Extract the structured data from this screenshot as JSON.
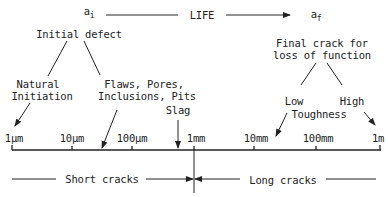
{
  "top": {
    "a_initial": {
      "base": "a",
      "sub": "i"
    },
    "life_label": "LIFE",
    "a_final": {
      "base": "a",
      "sub": "f"
    }
  },
  "initial_defect": {
    "title": "Initial defect",
    "branches": [
      {
        "lines": [
          "Natural",
          "Initiation"
        ]
      },
      {
        "lines": [
          "Flaws, Pores,",
          "Inclusions, Pits"
        ]
      }
    ],
    "slag": "Slag"
  },
  "final_crack": {
    "title_lines": [
      "Final crack for",
      "loss of function"
    ],
    "low": "Low",
    "high": "High",
    "toughness": "Toughness"
  },
  "axis": {
    "ticks": [
      "1μm",
      "10μm",
      "100μm",
      "1mm",
      "10mm",
      "100mm",
      "1m"
    ]
  },
  "regions": {
    "short": "Short cracks",
    "long": "Long cracks"
  },
  "colors": {
    "ink": "#222222",
    "background": "#ffffff"
  }
}
